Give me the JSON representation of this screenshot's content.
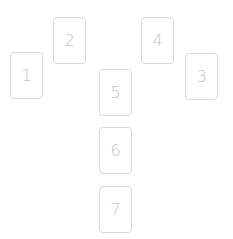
{
  "spread": {
    "cards": [
      {
        "position": "1",
        "x": 10,
        "y": 52
      },
      {
        "position": "2",
        "x": 53,
        "y": 17
      },
      {
        "position": "3",
        "x": 185,
        "y": 53
      },
      {
        "position": "4",
        "x": 141,
        "y": 17
      },
      {
        "position": "5",
        "x": 99,
        "y": 69
      },
      {
        "position": "6",
        "x": 99,
        "y": 127
      },
      {
        "position": "7",
        "x": 99,
        "y": 186
      }
    ]
  },
  "colors": {
    "card_border": "#d9d9d9",
    "card_number": "#c4c4c4",
    "background": "#ffffff"
  }
}
